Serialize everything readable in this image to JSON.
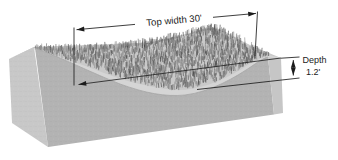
{
  "figure": {
    "annotations": {
      "top_width": {
        "label": "Top width 30'"
      },
      "depth": {
        "label_line1": "Depth",
        "label_line2": "1.2'"
      }
    },
    "colors": {
      "background": "#ffffff",
      "left_face": "#c8c8c8",
      "front_face": "#b3b3b3",
      "right_face": "#c6c6c6",
      "top_face": "#c9c9c9",
      "swale_band": "#d5d5d5",
      "lip_edge": "#9a9a9a",
      "grass_dark": "#484848",
      "grass_mid": "#6e6e6e",
      "grass_light": "#949494",
      "annotation": "#1c1c1c"
    }
  }
}
